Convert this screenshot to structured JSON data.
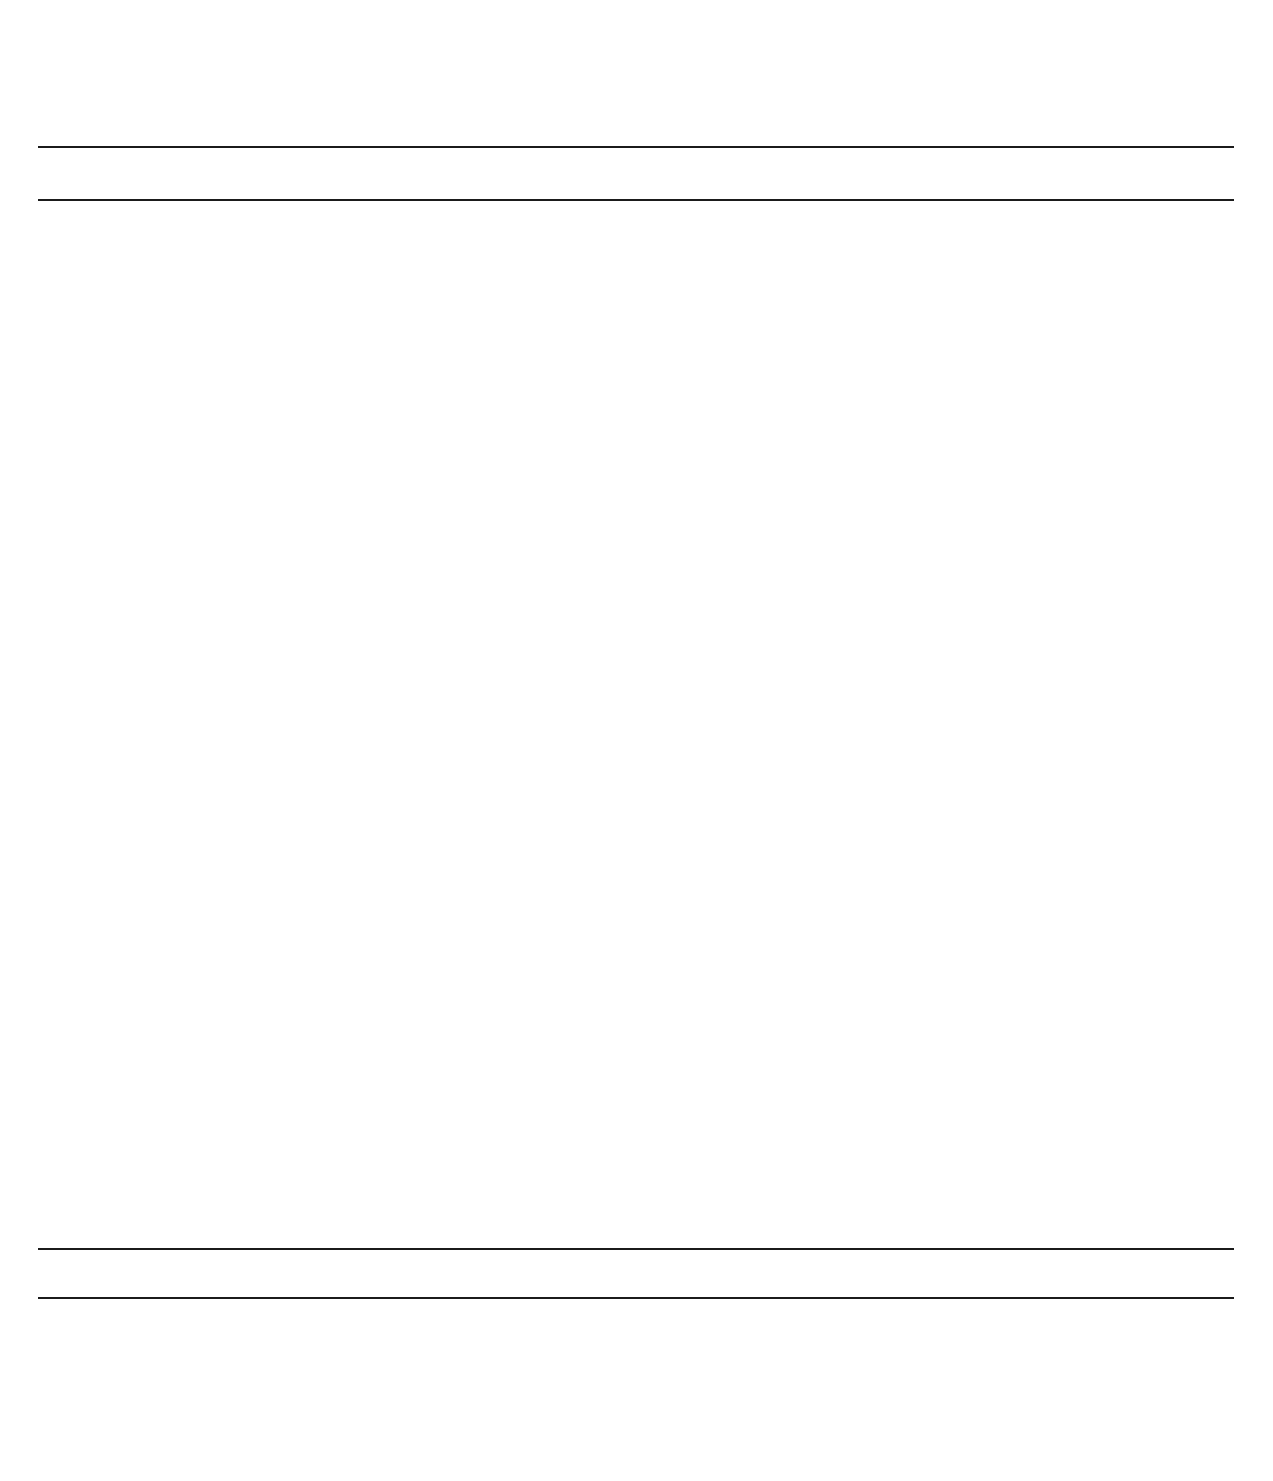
{
  "axis": {
    "year_min": 1680,
    "year_max": 2010,
    "px_per_year": 3.43,
    "origin_year": 1700,
    "origin_px": 131,
    "ticks": [
      {
        "label": "1700",
        "year": 1700
      },
      {
        "label": "1750",
        "year": 1750
      },
      {
        "label": "1800",
        "year": 1800
      },
      {
        "label": "1850",
        "year": 1850
      },
      {
        "label": "1900",
        "year": 1900
      },
      {
        "label": "1950",
        "year": 1950
      },
      {
        "label": "2000",
        "year": 2000
      }
    ]
  },
  "periods": [
    {
      "name": "BAROQUE PERIOD",
      "years": "1600-1750",
      "start": 1600,
      "end": 1750,
      "center_px": 182
    },
    {
      "name": "CLASSICAL PERIOD",
      "years": "1750-1827",
      "start": 1750,
      "end": 1827,
      "center_px": 415
    },
    {
      "name": "ROMANTIC PERIOD",
      "years": "1827-1900",
      "start": 1827,
      "end": 1900,
      "center_px": 689
    },
    {
      "name": "CONTEMPORARY",
      "years": "1900-PRESENT DAY",
      "start": 1900,
      "end": 2010,
      "center_px": 1033
    }
  ],
  "chart_data": {
    "type": "bar",
    "xlabel": "",
    "ylabel": "",
    "xlim": [
      1680,
      2010
    ],
    "orientation": "horizontal-range",
    "grid": true,
    "categories": [
      "Johann Sebastian Bach",
      "Franz Joseph Haydn",
      "Wolfgang Amadeus Mozart",
      "Ludwig von Beethoven",
      "Johann Strauss II",
      "Johannes Brahms",
      "Camille Saint-Saens",
      "Georges Bizet",
      "Antonin Dvorak",
      "Edvard Grieg"
    ],
    "ranges": [
      [
        1685,
        1750
      ],
      [
        1732,
        1809
      ],
      [
        1756,
        1791
      ],
      [
        1770,
        1827
      ],
      [
        1825,
        1899
      ],
      [
        1833,
        1897
      ],
      [
        1835,
        1921
      ],
      [
        1838,
        1875
      ],
      [
        1841,
        1904
      ],
      [
        1843,
        1907
      ]
    ]
  },
  "composers": [
    {
      "name": "Johann Sebastian Bach",
      "years": "1685-1750",
      "birth": 1685,
      "death": 1750,
      "label_x": 50,
      "name_y": 225,
      "years_y": 252,
      "bar_y": 283
    },
    {
      "name": "Franz Joseph Haydn",
      "years": "1732-1809",
      "birth": 1732,
      "death": 1809,
      "label_x": 229,
      "name_y": 332,
      "years_y": 363,
      "bar_y": 389
    },
    {
      "name": "Wolfgang Amadeus Mozart",
      "years": "1756-1791",
      "birth": 1756,
      "death": 1791,
      "label_x": 316,
      "name_y": 435,
      "years_y": 465,
      "bar_y": 492
    },
    {
      "name": "Ludwig von Beethoven",
      "years": "1770-1827",
      "birth": 1770,
      "death": 1827,
      "label_x": 373,
      "name_y": 538,
      "years_y": 568,
      "bar_y": 594
    },
    {
      "name": "Johann Strauss II",
      "years": "1825-1899",
      "birth": 1825,
      "death": 1899,
      "label_x": 545,
      "name_y": 645,
      "years_y": 675,
      "bar_y": 705
    },
    {
      "name": "Johannes Brahms",
      "years": "1833-1897",
      "birth": 1833,
      "death": 1897,
      "label_x": 561,
      "name_y": 752,
      "years_y": 782,
      "bar_y": 808
    },
    {
      "name": "Camille Saint-Saens",
      "years": "1835-1921",
      "birth": 1835,
      "death": 1921,
      "label_x": 576,
      "name_y": 858,
      "years_y": 888,
      "bar_y": 912
    },
    {
      "name": "Georges Bizet",
      "years": "1838-1875",
      "birth": 1838,
      "death": 1875,
      "label_x": 599,
      "name_y": 960,
      "years_y": 990,
      "bar_y": 1016
    },
    {
      "name": "Antonin Dvorak",
      "years": "1841-1904",
      "birth": 1841,
      "death": 1904,
      "label_x": 599,
      "name_y": 1065,
      "years_y": 1095,
      "bar_y": 1122
    },
    {
      "name": "Edvard Grieg",
      "years": "1843-1907",
      "birth": 1843,
      "death": 1907,
      "label_x": 593,
      "name_y": 1168,
      "years_y": 1198,
      "bar_y": 1226
    }
  ],
  "nicknames": [
    {
      "text": "\"Father of Symphonies\"",
      "x": 124,
      "y": 1321
    },
    {
      "text": "\"Waltz King\"",
      "x": 522,
      "y": 1321
    }
  ],
  "portraits": [
    {
      "composer": "Johann Sebastian Bach",
      "x": 21
    },
    {
      "composer": "Franz Joseph Haydn",
      "x": 145
    },
    {
      "composer": "Wolfgang Amadeus Mozart",
      "x": 269
    },
    {
      "composer": "Ludwig von Beethoven",
      "x": 393
    },
    {
      "composer": "Johann Strauss II",
      "x": 517
    },
    {
      "composer": "Johannes Brahms",
      "x": 641
    },
    {
      "composer": "Camille Saint-Saens",
      "x": 765
    },
    {
      "composer": "Georges Bizet",
      "x": 889
    },
    {
      "composer": "Antonin Dvorak",
      "x": 1013
    },
    {
      "composer": "Edvard Grieg",
      "x": 1137
    }
  ],
  "colors": {
    "bar": "#1c1c1c",
    "gridline": "#aeaeae",
    "axis": "#1b1b1b",
    "text": "#111111",
    "portrait_line": "#6d6d6d"
  }
}
